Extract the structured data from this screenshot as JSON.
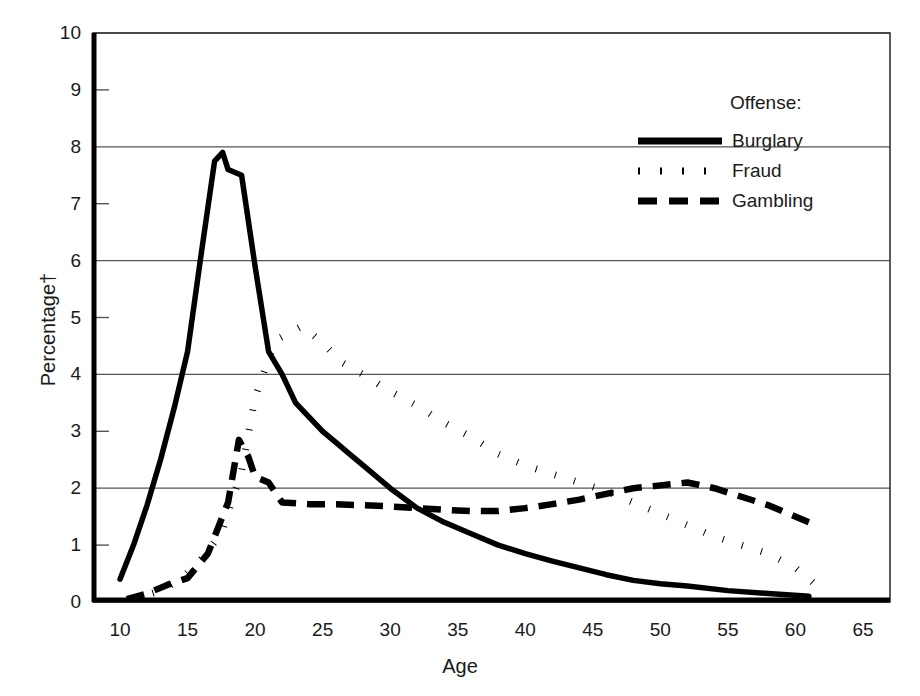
{
  "chart_data": {
    "type": "line",
    "title": "",
    "xlabel": "Age",
    "ylabel": "Percentage†",
    "xlim": [
      8,
      67
    ],
    "ylim": [
      0,
      10
    ],
    "xticks": [
      "10",
      "15",
      "20",
      "25",
      "30",
      "35",
      "40",
      "45",
      "50",
      "55",
      "60",
      "65"
    ],
    "xtick_values": [
      10,
      15,
      20,
      25,
      30,
      35,
      40,
      45,
      50,
      55,
      60,
      65
    ],
    "yticks": [
      "0",
      "1",
      "2",
      "3",
      "4",
      "5",
      "6",
      "7",
      "8",
      "9",
      "10"
    ],
    "ytick_values": [
      0,
      1,
      2,
      3,
      4,
      5,
      6,
      7,
      8,
      9,
      10
    ],
    "gridlines_y": [
      2,
      4,
      6,
      8,
      10
    ],
    "grid": "horizontal-major-only",
    "legend_position": "upper-right-inside",
    "legend_title": "Offense:",
    "series": [
      {
        "name": "Burglary",
        "style": "solid",
        "color": "#000000",
        "x": [
          10,
          11,
          12,
          13,
          14,
          15,
          16,
          17,
          17.6,
          18,
          19,
          20,
          21,
          22,
          23,
          24,
          25,
          26,
          27,
          28,
          30,
          32,
          34,
          36,
          38,
          40,
          42,
          44,
          46,
          48,
          50,
          52,
          55,
          58,
          61
        ],
        "y": [
          0.4,
          1.0,
          1.7,
          2.5,
          3.4,
          4.4,
          6.1,
          7.75,
          7.9,
          7.6,
          7.5,
          5.9,
          4.4,
          4.0,
          3.5,
          3.25,
          3.0,
          2.8,
          2.6,
          2.4,
          2.0,
          1.65,
          1.4,
          1.2,
          1.0,
          0.85,
          0.72,
          0.6,
          0.48,
          0.38,
          0.32,
          0.28,
          0.2,
          0.15,
          0.1
        ]
      },
      {
        "name": "Fraud",
        "style": "dotted",
        "color": "#000000",
        "x": [
          11,
          13,
          14.5,
          16,
          17.5,
          19,
          20,
          21.5,
          23.5,
          25,
          26.5,
          28,
          30,
          32,
          34,
          36,
          38,
          40,
          42,
          44,
          46,
          48,
          50,
          52,
          54,
          56,
          58,
          60,
          61.5
        ],
        "y": [
          0.05,
          0.2,
          0.4,
          0.75,
          1.2,
          2.3,
          3.6,
          4.6,
          4.85,
          4.55,
          4.2,
          4.0,
          3.7,
          3.45,
          3.15,
          2.9,
          2.6,
          2.4,
          2.25,
          2.1,
          1.95,
          1.75,
          1.55,
          1.35,
          1.15,
          1.0,
          0.85,
          0.6,
          0.3
        ]
      },
      {
        "name": "Gambling",
        "style": "dashed",
        "color": "#000000",
        "x": [
          10.5,
          12,
          13.5,
          15,
          16.5,
          18,
          18.8,
          19.5,
          20,
          21,
          22,
          24,
          26,
          28,
          30,
          32,
          34,
          36,
          38,
          40,
          42,
          44,
          46,
          48,
          50,
          52,
          54,
          56,
          58,
          61
        ],
        "y": [
          0.05,
          0.15,
          0.3,
          0.42,
          0.85,
          1.75,
          2.85,
          2.55,
          2.2,
          2.1,
          1.75,
          1.72,
          1.72,
          1.7,
          1.68,
          1.65,
          1.62,
          1.6,
          1.6,
          1.65,
          1.72,
          1.8,
          1.9,
          2.0,
          2.05,
          2.1,
          2.0,
          1.85,
          1.7,
          1.4
        ]
      }
    ]
  },
  "axis": {
    "y_label_text": "Percentage†",
    "x_label_text": "Age"
  },
  "legend": {
    "title": "Offense:",
    "entries": [
      {
        "label": "Burglary",
        "style": "solid"
      },
      {
        "label": "Fraud",
        "style": "dotted"
      },
      {
        "label": "Gambling",
        "style": "dashed"
      }
    ]
  }
}
